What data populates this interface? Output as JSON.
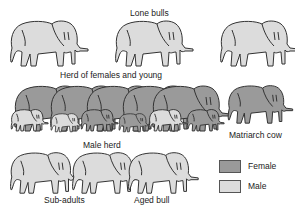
{
  "colors": {
    "female": "#9a9a9a",
    "male": "#dcdcdc",
    "outline": "#333333"
  },
  "groups": {
    "lone_bulls": {
      "label": "Lone bulls",
      "count": 3,
      "sex": "male"
    },
    "herd_females_young": {
      "label": "Herd of females and young",
      "adults": 5,
      "young": 6,
      "sex": "mixed"
    },
    "matriarch": {
      "label": "Matriarch cow",
      "sex": "female"
    },
    "male_herd": {
      "label": "Male herd",
      "count": 3,
      "sex": "male"
    },
    "sub_adults": {
      "label": "Sub-adults"
    },
    "aged_bull": {
      "label": "Aged bull"
    }
  },
  "legend": {
    "items": [
      {
        "label": "Female",
        "color": "#9a9a9a"
      },
      {
        "label": "Male",
        "color": "#dcdcdc"
      }
    ]
  }
}
